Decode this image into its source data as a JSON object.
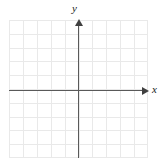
{
  "figure": {
    "width": 163,
    "height": 163,
    "background_color": "#ffffff"
  },
  "axes": {
    "x_axis": {
      "label": "x",
      "icon": "arrow-right-icon",
      "color": "#595959",
      "position_y": 90,
      "start_x": 9,
      "end_x": 149
    },
    "y_axis": {
      "label": "y",
      "icon": "arrow-up-icon",
      "color": "#595959",
      "position_x": 78,
      "start_y": 19,
      "end_y": 158
    }
  },
  "grid": {
    "color": "#e9e9e9",
    "left": 9,
    "top": 20,
    "width": 139,
    "height": 138,
    "cell_size": 13.9,
    "columns": 10,
    "rows": 10,
    "vertical_lines": [
      0,
      13.9,
      27.8,
      41.7,
      55.6,
      69.5,
      83.4,
      97.3,
      111.2,
      125.1,
      138
    ],
    "horizontal_lines": [
      0,
      13.8,
      27.6,
      41.4,
      55.2,
      69,
      82.8,
      96.6,
      110.4,
      124.2,
      137
    ]
  },
  "chart_data": {
    "type": "scatter",
    "title": "",
    "subtitle": "",
    "xlabel": "x",
    "ylabel": "y",
    "xlim": [
      -5,
      5
    ],
    "ylim": [
      -5,
      5
    ],
    "xticks": [
      -5,
      -4,
      -3,
      -2,
      -1,
      0,
      1,
      2,
      3,
      4,
      5
    ],
    "yticks": [
      -5,
      -4,
      -3,
      -2,
      -1,
      0,
      1,
      2,
      3,
      4,
      5
    ],
    "xticklabels": [
      "",
      "",
      "",
      "",
      "",
      "",
      "",
      "",
      "",
      "",
      ""
    ],
    "yticklabels": [
      "",
      "",
      "",
      "",
      "",
      "",
      "",
      "",
      "",
      "",
      ""
    ],
    "grid": true,
    "legend": null,
    "series": [],
    "annotations": []
  }
}
